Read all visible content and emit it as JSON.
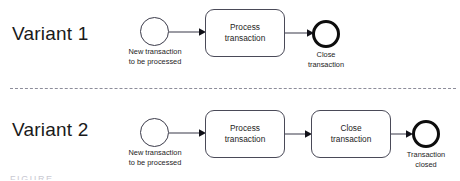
{
  "figure": {
    "type": "bpmn-process-variants",
    "footer_cut_text": "FIGURE"
  },
  "variants": [
    {
      "title": "Variant 1",
      "start_event": {
        "icon": "start-event-circle",
        "caption": "New transaction\nto be processed"
      },
      "tasks": [
        {
          "label": "Process\ntransaction"
        }
      ],
      "end_event": {
        "icon": "end-event-circle",
        "caption": "Close\ntransaction"
      }
    },
    {
      "title": "Variant 2",
      "start_event": {
        "icon": "start-event-circle",
        "caption": "New transaction\nto be processed"
      },
      "tasks": [
        {
          "label": "Process\ntransaction"
        },
        {
          "label": "Close\ntransaction"
        }
      ],
      "end_event": {
        "icon": "end-event-circle",
        "caption": "Transaction\nclosed"
      }
    }
  ],
  "connectors": {
    "icon": "sequence-flow-arrow"
  },
  "colors": {
    "stroke": "#3b3b4a",
    "end_event_stroke": "#0d0d0d",
    "text": "#1d1d1d",
    "divider": "#8d8d9a",
    "background": "#ffffff"
  }
}
